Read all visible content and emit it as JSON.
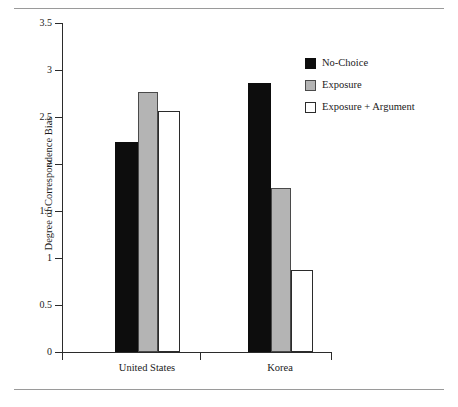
{
  "figure": {
    "top_rule": true,
    "bottom_rule": true
  },
  "chart_data": {
    "type": "bar",
    "title": "",
    "xlabel": "",
    "ylabel": "Degree of Correspondence Bias",
    "categories": [
      "United States",
      "Korea"
    ],
    "series": [
      {
        "name": "No-Choice",
        "color": "#0d0d0d",
        "values": [
          2.23,
          2.86
        ]
      },
      {
        "name": "Exposure",
        "color": "#b4b4b4",
        "values": [
          2.77,
          1.75
        ]
      },
      {
        "name": "Exposure + Argument",
        "color": "#ffffff",
        "values": [
          2.56,
          0.87
        ]
      }
    ],
    "ylim": [
      0,
      3.5
    ],
    "ytick_labels": [
      "3.5",
      "3",
      "2.5",
      "2",
      "1.5",
      "1",
      "0.5",
      "0"
    ],
    "ytick_values": [
      3.5,
      3,
      2.5,
      2,
      1.5,
      1,
      0.5,
      0
    ],
    "grid": false,
    "legend_position": "right-top"
  }
}
